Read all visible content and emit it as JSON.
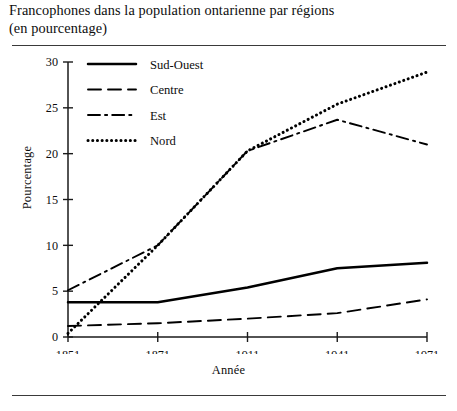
{
  "title": {
    "line1": "Francophones dans la population ontarienne par régions",
    "line2": "(en pourcentage)"
  },
  "axes": {
    "ylabel": "Pourcentage",
    "xlabel": "Année",
    "yticks": [
      "0",
      "5",
      "10",
      "15",
      "20",
      "25",
      "30"
    ],
    "xticks": [
      "1851",
      "1871",
      "1911",
      "1941",
      "1971"
    ]
  },
  "legend": {
    "items": [
      {
        "label": "Sud-Ouest",
        "style": "solid"
      },
      {
        "label": "Centre",
        "style": "dashed"
      },
      {
        "label": "Est",
        "style": "dashdot"
      },
      {
        "label": "Nord",
        "style": "dotted"
      }
    ]
  },
  "chart_data": {
    "type": "line",
    "title": "Francophones dans la population ontarienne par régions (en pourcentage)",
    "xlabel": "Année",
    "ylabel": "Pourcentage",
    "categories": [
      "1851",
      "1871",
      "1911",
      "1941",
      "1971"
    ],
    "x": [
      1851,
      1871,
      1911,
      1941,
      1971
    ],
    "ylim": [
      0,
      30
    ],
    "ytick_step": 5,
    "grid": false,
    "legend_position": "upper-left-inside",
    "series": [
      {
        "name": "Sud-Ouest",
        "style": "solid",
        "color": "#000000",
        "values": [
          3.8,
          3.8,
          5.4,
          7.5,
          8.1
        ]
      },
      {
        "name": "Centre",
        "style": "dashed",
        "color": "#000000",
        "values": [
          1.2,
          1.5,
          2.0,
          2.6,
          4.1
        ]
      },
      {
        "name": "Est",
        "style": "dashdot",
        "color": "#000000",
        "values": [
          5.1,
          10.0,
          20.3,
          23.7,
          21.0
        ]
      },
      {
        "name": "Nord",
        "style": "dotted",
        "color": "#000000",
        "values": [
          0.4,
          10.0,
          20.3,
          25.4,
          28.9
        ]
      }
    ]
  }
}
